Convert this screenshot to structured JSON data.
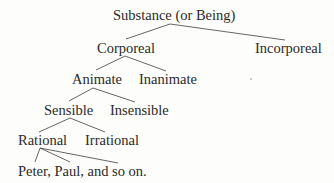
{
  "diagram": {
    "type": "tree",
    "nodes": {
      "root": "Substance (or Being)",
      "corporeal": "Corporeal",
      "incorporeal": "Incorporeal",
      "animate": "Animate",
      "inanimate": "Inanimate",
      "sensible": "Sensible",
      "insensible": "Insensible",
      "rational": "Rational",
      "irrational": "Irrational",
      "individuals": "Peter, Paul, and so on."
    },
    "edges": [
      [
        "root",
        "corporeal"
      ],
      [
        "root",
        "incorporeal"
      ],
      [
        "corporeal",
        "animate"
      ],
      [
        "corporeal",
        "inanimate"
      ],
      [
        "animate",
        "sensible"
      ],
      [
        "animate",
        "insensible"
      ],
      [
        "sensible",
        "rational"
      ],
      [
        "sensible",
        "irrational"
      ],
      [
        "rational",
        "individuals"
      ]
    ]
  }
}
